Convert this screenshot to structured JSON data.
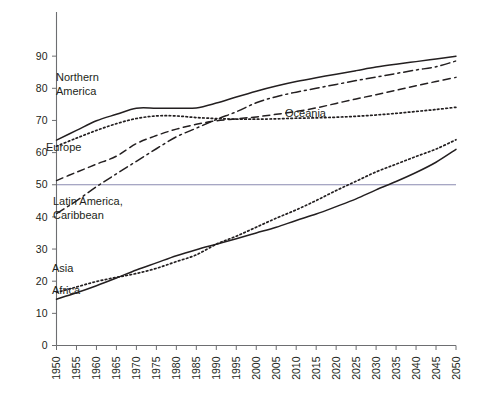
{
  "chart_data": {
    "type": "line",
    "title": "",
    "subtitle": "",
    "xlabel": "",
    "ylabel": "",
    "xlim": [
      1950,
      2050
    ],
    "ylim": [
      0,
      95
    ],
    "grid": false,
    "legend_position": "inline-labels",
    "y_ticks": [
      0,
      10,
      20,
      30,
      40,
      50,
      60,
      70,
      80,
      90
    ],
    "y_tick_labels": [
      "0",
      "10",
      "20",
      "30",
      "40",
      "50",
      "60",
      "70",
      "80",
      "90"
    ],
    "x": [
      1950,
      1955,
      1960,
      1965,
      1970,
      1975,
      1980,
      1985,
      1990,
      1995,
      2000,
      2005,
      2010,
      2015,
      2020,
      2025,
      2030,
      2035,
      2040,
      2045,
      2050
    ],
    "x_tick_labels": [
      "1950",
      "1955",
      "1960",
      "1965",
      "1970",
      "1975",
      "1980",
      "1985",
      "1990",
      "1995",
      "2000",
      "2005",
      "2010",
      "2015",
      "2020",
      "2025",
      "2030",
      "2035",
      "2040",
      "2045",
      "2050"
    ],
    "annotations": [
      {
        "text": "50",
        "type": "reference-line",
        "value": 50,
        "orientation": "horizontal",
        "color": "#8a8ab0"
      }
    ],
    "series": [
      {
        "name": "Northern America",
        "label": "Northern America",
        "label_lines": [
          "Northern",
          "America"
        ],
        "style": "solid",
        "color": "#231f20",
        "values": [
          63.9,
          66.9,
          69.9,
          71.9,
          73.8,
          73.8,
          73.8,
          73.9,
          75.4,
          77.3,
          79.1,
          80.7,
          82.1,
          83.3,
          84.4,
          85.5,
          86.6,
          87.5,
          88.3,
          89.1,
          90.0
        ]
      },
      {
        "name": "Oceania",
        "label": "Oceania",
        "label_lines": [
          "Oceania"
        ],
        "style": "dotted",
        "color": "#231f20",
        "values": [
          62.0,
          64.5,
          66.9,
          69.0,
          70.6,
          71.4,
          71.4,
          70.9,
          70.6,
          70.4,
          70.4,
          70.5,
          70.7,
          70.8,
          71.0,
          71.3,
          71.7,
          72.2,
          72.8,
          73.4,
          74.1
        ]
      },
      {
        "name": "Europe",
        "label": "Europe",
        "label_lines": [
          "Europe"
        ],
        "style": "dashed",
        "color": "#231f20",
        "values": [
          51.3,
          53.9,
          56.4,
          58.9,
          62.8,
          65.3,
          67.3,
          68.8,
          69.9,
          70.5,
          71.1,
          71.9,
          72.8,
          73.9,
          75.3,
          76.7,
          78.0,
          79.4,
          80.8,
          82.1,
          83.4
        ]
      },
      {
        "name": "Latin America, Caribbean",
        "label": "Latin America, Caribbean",
        "label_lines": [
          "Latin America,",
          "Caribbean"
        ],
        "style": "dash-dot",
        "color": "#231f20",
        "values": [
          41.0,
          45.0,
          49.4,
          53.4,
          57.3,
          61.2,
          64.9,
          67.6,
          70.3,
          72.7,
          75.5,
          77.4,
          78.8,
          80.0,
          81.2,
          82.4,
          83.5,
          84.6,
          85.7,
          86.7,
          88.5
        ]
      },
      {
        "name": "Asia",
        "label": "Asia",
        "label_lines": [
          "Asia"
        ],
        "style": "dotted",
        "color": "#231f20",
        "values": [
          16.5,
          18.2,
          19.9,
          21.2,
          22.4,
          24.0,
          26.1,
          28.2,
          31.5,
          34.0,
          36.8,
          39.6,
          42.2,
          45.1,
          48.2,
          51.1,
          54.0,
          56.4,
          58.8,
          61.1,
          64.0
        ]
      },
      {
        "name": "Africa",
        "label": "Africa",
        "label_lines": [
          "Africa"
        ],
        "style": "solid",
        "color": "#231f20",
        "values": [
          14.4,
          16.4,
          18.6,
          21.0,
          23.5,
          25.7,
          27.9,
          29.8,
          31.5,
          33.2,
          35.0,
          36.8,
          38.9,
          40.9,
          43.2,
          45.6,
          48.4,
          51.0,
          53.8,
          57.0,
          61.0
        ]
      }
    ],
    "series_labels_positions": [
      {
        "name": "Northern America",
        "x_px": 56,
        "y_px": 81
      },
      {
        "name": "Oceania",
        "x_px": 285,
        "y_px": 117
      },
      {
        "name": "Europe",
        "x_px": 46,
        "y_px": 151
      },
      {
        "name": "Latin America, Caribbean",
        "x_px": 53,
        "y_px": 205
      },
      {
        "name": "Asia",
        "x_px": 52,
        "y_px": 272
      },
      {
        "name": "Africa",
        "x_px": 52,
        "y_px": 294
      }
    ]
  }
}
